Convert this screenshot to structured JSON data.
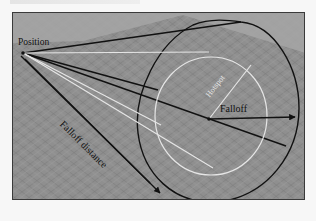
{
  "figure": {
    "type": "spotlight-parameters-diagram",
    "labels": {
      "position": "Position",
      "hotspot": "Hotspot",
      "falloff": "Falloff",
      "falloff_distance": "Falloff distance"
    },
    "colors": {
      "background_page": "#f7f7f7",
      "ground_plane": "#8e8e8e",
      "sky_area": "#a4a4a4",
      "grid_lines": "#7a7a7a",
      "falloff_cone": "#111111",
      "hotspot_cone": "#e6e6e6",
      "frame_border": "#3a3a3a"
    },
    "elements": [
      "position point at cone apex",
      "black falloff cone (outer circle)",
      "white hotspot cone (inner circle)",
      "hotspot radius line",
      "falloff radius arrow",
      "falloff distance arrow"
    ]
  }
}
